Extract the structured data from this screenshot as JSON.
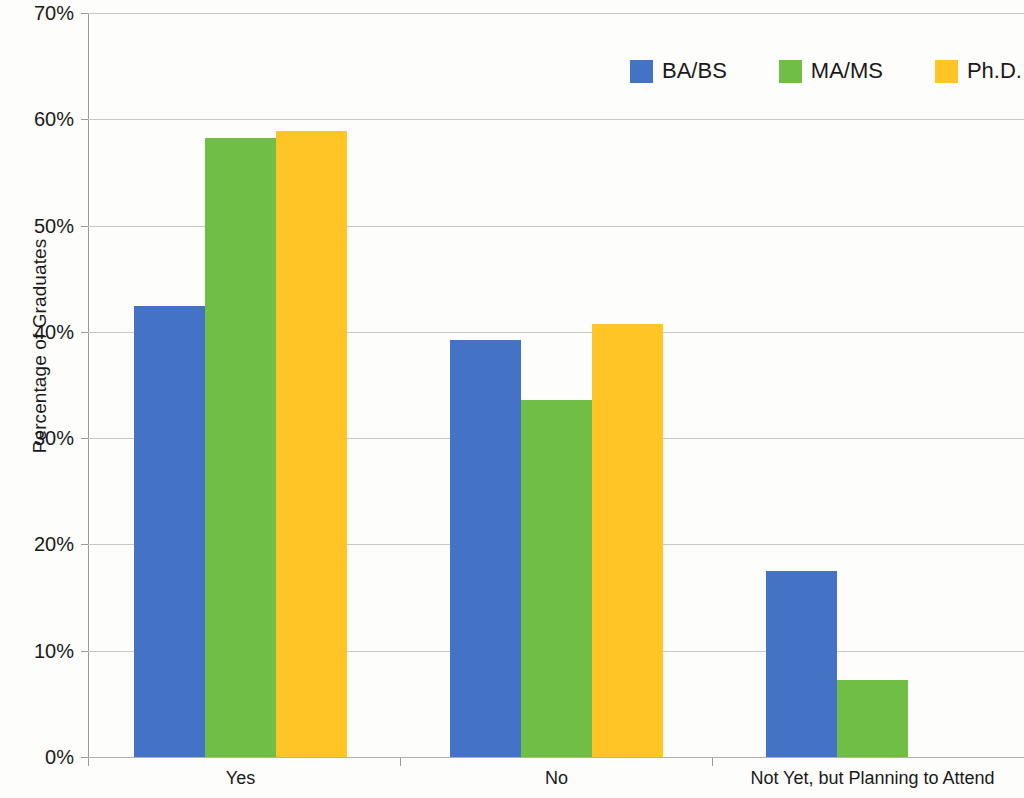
{
  "chart_data": {
    "type": "bar",
    "title": "",
    "subtitle": "",
    "xlabel": "",
    "ylabel": "Percentage of Graduates",
    "categories": [
      "Yes",
      "No",
      "Not Yet, but Planning to Attend"
    ],
    "series": [
      {
        "name": "BA/BS",
        "color": "#4472C4",
        "values": [
          42.4,
          39.2,
          17.5
        ]
      },
      {
        "name": "MA/MS",
        "color": "#70BE45",
        "values": [
          58.2,
          33.6,
          7.2
        ]
      },
      {
        "name": "Ph.D.",
        "color": "#FFC425",
        "values": [
          58.9,
          40.7,
          0
        ]
      }
    ],
    "ylim": [
      0,
      70
    ],
    "y_ticks": [
      0,
      10,
      20,
      30,
      40,
      50,
      60,
      70
    ],
    "y_tick_labels": [
      "0%",
      "10%",
      "20%",
      "30%",
      "40%",
      "50%",
      "60%",
      "70%"
    ],
    "grid": true,
    "legend_position": "top-right"
  },
  "axis": {
    "y_title": "Percentage of Graduates",
    "y_labels": [
      "70%",
      "60%",
      "50%",
      "40%",
      "30%",
      "20%",
      "10%",
      "0%"
    ],
    "x_labels": [
      "Yes",
      "No",
      "Not Yet, but Planning to Attend"
    ]
  },
  "legend": {
    "items": [
      {
        "label": "BA/BS",
        "color": "#4472C4"
      },
      {
        "label": "MA/MS",
        "color": "#70BE45"
      },
      {
        "label": "Ph.D.",
        "color": "#FFC425"
      }
    ]
  }
}
